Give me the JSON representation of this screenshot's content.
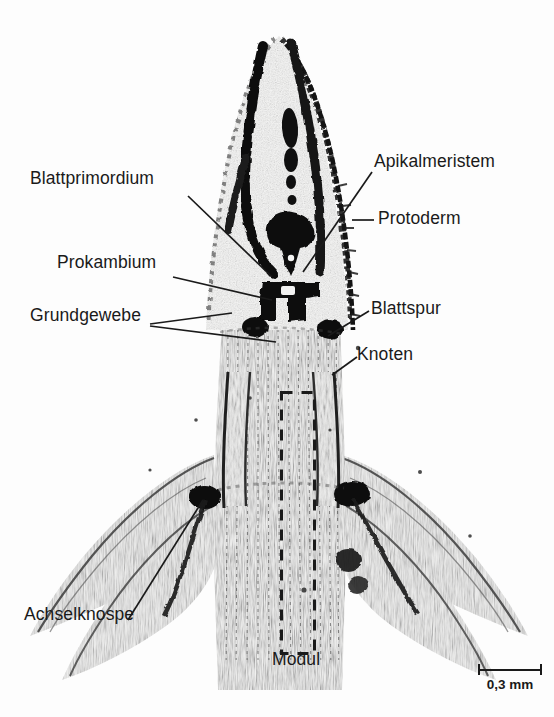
{
  "figure": {
    "kind": "light-micrograph",
    "background_color": "#fdfdfd",
    "ink_color": "#1a1a1a"
  },
  "labels": [
    {
      "id": "blattprimordium",
      "text": "Blattprimordium",
      "side": "left",
      "x": 30,
      "y": 178
    },
    {
      "id": "prokambium",
      "text": "Prokambium",
      "side": "left",
      "x": 57,
      "y": 261
    },
    {
      "id": "grundgewebe",
      "text": "Grundgewebe",
      "side": "left",
      "x": 30,
      "y": 315
    },
    {
      "id": "achselknospe",
      "text": "Achselknospe",
      "side": "left",
      "x": 24,
      "y": 613
    },
    {
      "id": "apikalmeristem",
      "text": "Apikalmeristem",
      "side": "right",
      "x": 374,
      "y": 161
    },
    {
      "id": "protoderm",
      "text": "Protoderm",
      "side": "right",
      "x": 378,
      "y": 210
    },
    {
      "id": "blattspur",
      "text": "Blattspur",
      "side": "right",
      "x": 371,
      "y": 300
    },
    {
      "id": "knoten",
      "text": "Knoten",
      "side": "right",
      "x": 357,
      "y": 348
    },
    {
      "id": "modul",
      "text": "Modul",
      "side": "bottom",
      "x": 272,
      "y": 659
    }
  ],
  "module_box": {
    "name": "Modul",
    "style": "dashed-rectangle",
    "x": 281,
    "y": 392,
    "width": 33,
    "height": 261
  },
  "scale_bar": {
    "value": "0,3 mm",
    "length_px": 64
  },
  "bleed_through_text": [
    {
      "text": "mechanism und",
      "x": 382,
      "y": 22,
      "size": 17
    },
    {
      "text": "los ( - ) sind",
      "x": 392,
      "y": 48,
      "size": 17
    },
    {
      "text": "2.1  Der mechanische",
      "x": 368,
      "y": 218,
      "size": 19
    },
    {
      "text": "sprossachse mit",
      "x": 372,
      "y": 252,
      "size": 14
    },
    {
      "text": "ist die paarige",
      "x": 378,
      "y": 278,
      "size": 14
    },
    {
      "text": "Blattanlage",
      "x": 380,
      "y": 302,
      "size": 14
    },
    {
      "text": "lie",
      "x": 368,
      "y": 330,
      "size": 14
    }
  ]
}
